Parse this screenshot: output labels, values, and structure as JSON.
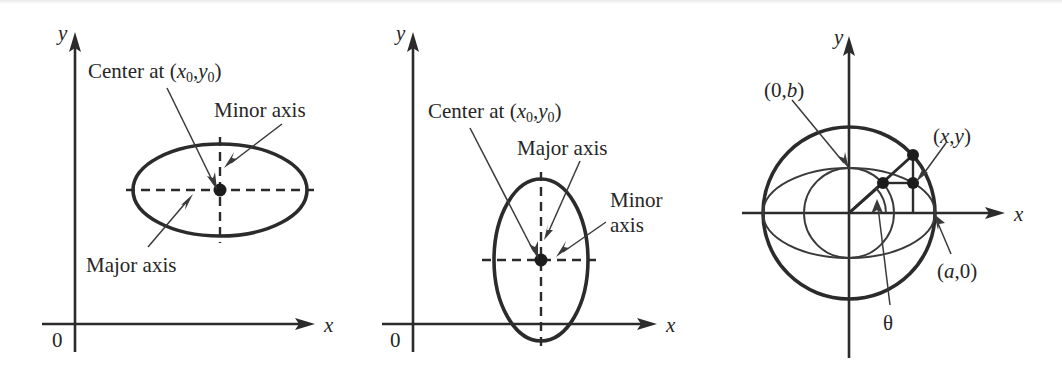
{
  "figure": {
    "kind": "ellipse-geometry-figure",
    "panel_count": 3,
    "ink_color": "#2b2b2b",
    "background_color": "#ffffff"
  },
  "panels": [
    {
      "id": "horizontal-ellipse",
      "axis_x_label": "x",
      "axis_y_label": "y",
      "origin_label": "0",
      "labels": {
        "center": {
          "prefix": "Center at (",
          "var1": "x",
          "sub1": "0",
          "comma": ",",
          "var2": "y",
          "sub2": "0",
          "suffix": ")"
        },
        "minor_axis": "Minor axis",
        "major_axis": "Major axis"
      },
      "geometry": {
        "center": [
          220,
          190
        ],
        "semi_major_x": 87,
        "semi_minor_y": 46,
        "orientation": "horizontal"
      }
    },
    {
      "id": "vertical-ellipse",
      "axis_x_label": "x",
      "axis_y_label": "y",
      "origin_label": "0",
      "labels": {
        "center": {
          "prefix": "Center at (",
          "var1": "x",
          "sub1": "0",
          "comma": ",",
          "var2": "y",
          "sub2": "0",
          "suffix": ")"
        },
        "major_axis": "Major axis",
        "minor_axis_line1": "Minor",
        "minor_axis_line2": "axis"
      },
      "geometry": {
        "center": [
          187,
          260
        ],
        "semi_minor_x": 47,
        "semi_major_y": 81,
        "orientation": "vertical"
      }
    },
    {
      "id": "parametric-construction",
      "axis_x_label": "x",
      "axis_y_label": "y",
      "labels": {
        "point_b": {
          "prefix": "(0,",
          "var": "b",
          "suffix": ")"
        },
        "point_xy": {
          "prefix": "(",
          "var1": "x",
          "comma": ",",
          "var2": "y",
          "suffix": ")"
        },
        "point_a": {
          "prefix": "(",
          "var": "a",
          "suffix": ",0)"
        },
        "angle": "θ"
      },
      "geometry": {
        "origin": [
          141,
          213
        ],
        "circle_a_radius": 86,
        "circle_b_radius": 45,
        "ellipse_semi_x": 86,
        "ellipse_semi_y": 45,
        "theta_degrees": 42
      }
    }
  ]
}
